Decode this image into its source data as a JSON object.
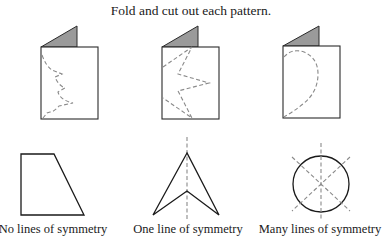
{
  "instruction": "Fold and cut out each pattern.",
  "folded_cards": [
    {
      "id": "card-1",
      "pattern": "tree-half",
      "flap_color": "#9a9a9a"
    },
    {
      "id": "card-2",
      "pattern": "zigzag-star-half",
      "flap_color": "#9a9a9a"
    },
    {
      "id": "card-3",
      "pattern": "heart-half",
      "flap_color": "#9a9a9a"
    }
  ],
  "shapes": [
    {
      "id": "trapezoid",
      "lines_of_symmetry": 0,
      "caption": "No lines of symmetry"
    },
    {
      "id": "arrowhead",
      "lines_of_symmetry": 1,
      "caption": "One line of symmetry"
    },
    {
      "id": "circle",
      "lines_of_symmetry": "many",
      "caption": "Many lines of symmetry"
    }
  ],
  "colors": {
    "outline": "#2a2a2a",
    "dashed": "#8a8a8a",
    "flap": "#9a9a9a"
  }
}
